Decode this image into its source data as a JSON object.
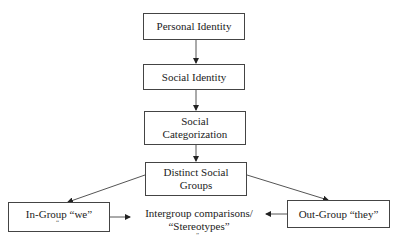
{
  "nodes": {
    "personal_identity": "Personal Identity",
    "social_identity": "Social Identity",
    "social_categorization_line1": "Social",
    "social_categorization_line2": "Categorization",
    "distinct_groups_line1": "Distinct Social",
    "distinct_groups_line2": "Groups",
    "in_group": "In-Group “we”",
    "out_group": "Out-Group “they”",
    "intergroup_line1": "Intergroup comparisons/",
    "intergroup_line2": "“Stereotypes”"
  },
  "stray_marks": {
    "in_group_mark": "“",
    "intergroup_mark": "”"
  },
  "edges": [
    {
      "from": "Personal Identity",
      "to": "Social Identity"
    },
    {
      "from": "Social Identity",
      "to": "Social Categorization"
    },
    {
      "from": "Social Categorization",
      "to": "Distinct Social Groups"
    },
    {
      "from": "Distinct Social Groups",
      "to": "In-Group “we”"
    },
    {
      "from": "Distinct Social Groups",
      "to": "Out-Group “they”"
    },
    {
      "from": "In-Group “we”",
      "to": "Intergroup comparisons/ “Stereotypes”"
    },
    {
      "from": "Out-Group “they”",
      "to": "Intergroup comparisons/ “Stereotypes”"
    }
  ]
}
